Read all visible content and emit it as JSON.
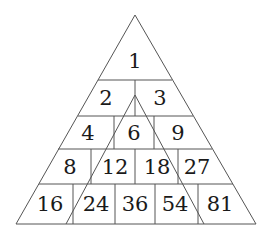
{
  "diagram": {
    "type": "number-triangle",
    "rows": [
      [
        "1"
      ],
      [
        "2",
        "3"
      ],
      [
        "4",
        "6",
        "9"
      ],
      [
        "8",
        "12",
        "18",
        "27"
      ],
      [
        "16",
        "24",
        "36",
        "54",
        "81"
      ]
    ],
    "colors": {
      "line": "#555555",
      "text": "#1a1a1a",
      "background": "#ffffff"
    }
  }
}
